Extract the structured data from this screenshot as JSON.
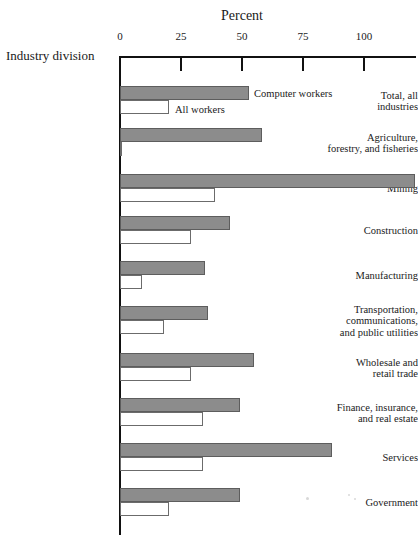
{
  "chart_data": {
    "type": "bar",
    "orientation": "horizontal",
    "title": "Percent",
    "xlabel": "Percent",
    "ylabel": "Industry division",
    "xlim": [
      0,
      125
    ],
    "xticks": [
      0,
      25,
      50,
      75,
      100
    ],
    "xtick_labels": [
      "0",
      "25",
      "50",
      "75",
      "100"
    ],
    "grid": false,
    "legend_position": "inside-top",
    "categories": [
      "Total, all industries",
      "Agriculture, forestry, and fisheries",
      "Mining",
      "Construction",
      "Manufacturing",
      "Transportation, communications, and public utilities",
      "Wholesale and retail trade",
      "Finance, insurance, and real estate",
      "Services",
      "Government"
    ],
    "category_label_lines": [
      [
        "Total, all",
        "industries"
      ],
      [
        "Agriculture,",
        "forestry, and fisheries"
      ],
      [
        "Mining"
      ],
      [
        "Construction"
      ],
      [
        "Manufacturing"
      ],
      [
        "Transportation,",
        "communications,",
        "and public utilities"
      ],
      [
        "Wholesale and",
        "retail trade"
      ],
      [
        "Finance, insurance,",
        "and real estate"
      ],
      [
        "Services"
      ],
      [
        "Government"
      ]
    ],
    "series": [
      {
        "name": "Computer workers",
        "color": "#8c8c8c",
        "values": [
          53,
          58,
          121,
          45,
          35,
          36,
          55,
          49,
          87,
          49
        ]
      },
      {
        "name": "All workers",
        "color": "#ffffff",
        "values": [
          20,
          1,
          39,
          29,
          9,
          18,
          29,
          34,
          34,
          20
        ]
      }
    ]
  },
  "axis": {
    "x_title": "Percent",
    "y_title": "Industry division",
    "tick_labels": [
      "0",
      "25",
      "50",
      "75",
      "100"
    ]
  },
  "legend": {
    "computer_workers": "Computer workers",
    "all_workers": "All workers"
  },
  "colors": {
    "bar_computer_fill": "#8c8c8c",
    "bar_computer_stroke": "#5d5d5d",
    "bar_all_fill": "#ffffff",
    "bar_all_stroke": "#6b6b6b",
    "axis": "#111111",
    "text": "#1a1a1a"
  }
}
